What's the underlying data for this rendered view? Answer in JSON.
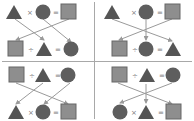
{
  "colors": {
    "shape_fill": "#555555",
    "square_fill": "#8e8e8e",
    "square_stroke": "#666666",
    "arrow": "#9a9a9a",
    "divider": "#a8a8a8"
  },
  "quadrants": [
    {
      "position": "top-left",
      "top_row": [
        "triangle",
        "×",
        "circle",
        "=",
        "square"
      ],
      "bottom_row": [
        "square",
        "÷",
        "triangle",
        "=",
        "circle"
      ],
      "arrows": [
        [
          "triangle",
          "triangle"
        ],
        [
          "circle",
          "circle"
        ],
        [
          "square",
          "square"
        ]
      ]
    },
    {
      "position": "top-right",
      "top_row": [
        "triangle",
        "×",
        "circle",
        "=",
        "square"
      ],
      "bottom_row": [
        "square",
        "÷",
        "circle",
        "=",
        "triangle"
      ],
      "arrows": [
        [
          "triangle",
          "triangle"
        ],
        [
          "circle",
          "circle"
        ],
        [
          "square",
          "square"
        ]
      ]
    },
    {
      "position": "bottom-left",
      "top_row": [
        "square",
        "÷",
        "triangle",
        "=",
        "circle"
      ],
      "bottom_row": [
        "triangle",
        "×",
        "circle",
        "=",
        "square"
      ],
      "arrows": [
        [
          "square",
          "square"
        ],
        [
          "triangle",
          "triangle"
        ],
        [
          "circle",
          "circle"
        ]
      ]
    },
    {
      "position": "bottom-right",
      "top_row": [
        "square",
        "÷",
        "triangle",
        "=",
        "circle"
      ],
      "bottom_row": [
        "circle",
        "×",
        "triangle",
        "=",
        "square"
      ],
      "arrows": [
        [
          "square",
          "square"
        ],
        [
          "triangle",
          "triangle"
        ],
        [
          "circle",
          "circle"
        ]
      ]
    }
  ],
  "ops": {
    "times": "×",
    "divide": "÷",
    "equals": "="
  }
}
